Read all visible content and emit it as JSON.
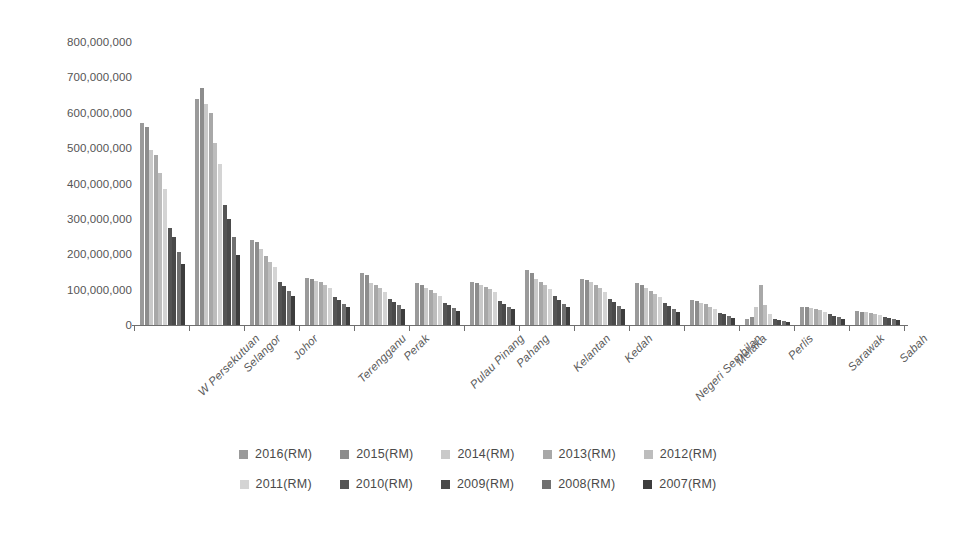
{
  "chart_data": {
    "type": "bar",
    "title": "",
    "subtitle": "",
    "xlabel": "",
    "ylabel": "",
    "ylim": [
      0,
      800000000
    ],
    "grid": false,
    "legend_position": "bottom",
    "orientation": "vertical",
    "grouping": "grouped",
    "y_ticks": [
      0,
      100000000,
      200000000,
      300000000,
      400000000,
      500000000,
      600000000,
      700000000,
      800000000
    ],
    "y_tick_labels": [
      "0",
      "100,000,000",
      "200,000,000",
      "300,000,000",
      "400,000,000",
      "500,000,000",
      "600,000,000",
      "700,000,000",
      "800,000,000"
    ],
    "categories": [
      "W Persekutuan",
      "Selangor",
      "Johor",
      "Terengganu",
      "Perak",
      "Pulau Pinang",
      "Pahang",
      "Kelantan",
      "Kedah",
      "Negeri Sembilan",
      "Melaka",
      "Perlis",
      "Sarawak",
      "Sabah"
    ],
    "series": [
      {
        "name": "2016(RM)",
        "color": "#9a9a9a",
        "values": [
          570000000,
          640000000,
          240000000,
          132000000,
          148000000,
          118000000,
          122000000,
          155000000,
          130000000,
          120000000,
          72000000,
          18000000,
          52000000,
          40000000
        ]
      },
      {
        "name": "2015(RM)",
        "color": "#8d8d8d",
        "values": [
          560000000,
          670000000,
          235000000,
          130000000,
          140000000,
          112000000,
          118000000,
          146000000,
          128000000,
          112000000,
          68000000,
          22000000,
          50000000,
          38000000
        ]
      },
      {
        "name": "2014(RM)",
        "color": "#c9c9c9",
        "values": [
          495000000,
          625000000,
          215000000,
          125000000,
          120000000,
          104000000,
          112000000,
          130000000,
          122000000,
          104000000,
          62000000,
          52000000,
          48000000,
          36000000
        ]
      },
      {
        "name": "2013(RM)",
        "color": "#a8a8a8",
        "values": [
          480000000,
          600000000,
          196000000,
          122000000,
          112000000,
          98000000,
          108000000,
          122000000,
          112000000,
          96000000,
          58000000,
          112000000,
          45000000,
          34000000
        ]
      },
      {
        "name": "2012(RM)",
        "color": "#bdbdbd",
        "values": [
          430000000,
          515000000,
          178000000,
          112000000,
          104000000,
          90000000,
          102000000,
          112000000,
          104000000,
          88000000,
          52000000,
          56000000,
          42000000,
          31000000
        ]
      },
      {
        "name": "2011(RM)",
        "color": "#d4d4d4",
        "values": [
          385000000,
          455000000,
          165000000,
          104000000,
          94000000,
          82000000,
          92000000,
          102000000,
          92000000,
          80000000,
          46000000,
          30000000,
          38000000,
          28000000
        ]
      },
      {
        "name": "2010(RM)",
        "color": "#555555",
        "values": [
          275000000,
          340000000,
          122000000,
          78000000,
          74000000,
          62000000,
          68000000,
          82000000,
          74000000,
          62000000,
          34000000,
          16000000,
          30000000,
          22000000
        ]
      },
      {
        "name": "2009(RM)",
        "color": "#4a4a4a",
        "values": [
          250000000,
          300000000,
          110000000,
          70000000,
          66000000,
          56000000,
          60000000,
          72000000,
          64000000,
          55000000,
          30000000,
          13000000,
          26000000,
          19000000
        ]
      },
      {
        "name": "2008(RM)",
        "color": "#707070",
        "values": [
          205000000,
          250000000,
          96000000,
          60000000,
          56000000,
          48000000,
          52000000,
          60000000,
          54000000,
          46000000,
          25000000,
          11000000,
          22000000,
          16000000
        ]
      },
      {
        "name": "2007(RM)",
        "color": "#3d3d3d",
        "values": [
          172000000,
          198000000,
          82000000,
          50000000,
          46000000,
          40000000,
          44000000,
          50000000,
          45000000,
          38000000,
          20000000,
          9000000,
          18000000,
          13000000
        ]
      }
    ]
  },
  "legend": {
    "rows": [
      [
        "2016(RM)",
        "2015(RM)",
        "2014(RM)",
        "2013(RM)",
        "2012(RM)"
      ],
      [
        "2011(RM)",
        "2010(RM)",
        "2009(RM)",
        "2008(RM)",
        "2007(RM)"
      ]
    ]
  },
  "axis": {
    "color": "#6f6f6f"
  }
}
